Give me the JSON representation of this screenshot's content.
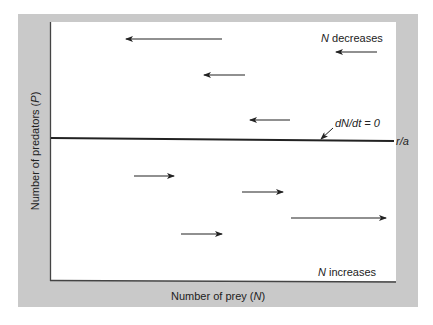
{
  "chart_data": {
    "type": "diagram",
    "title": "",
    "xlabel": "Number of prey (N)",
    "ylabel": "Number of predators (P)",
    "isocline": {
      "label": "dN/dt = 0",
      "y_intercept_label": "r/a",
      "orientation": "horizontal"
    },
    "regions": [
      {
        "position": "above",
        "label": "N decreases",
        "arrow_direction": "left"
      },
      {
        "position": "below",
        "label": "N increases",
        "arrow_direction": "right"
      }
    ],
    "arrows": [
      {
        "x1": 222,
        "y1": 39,
        "x2": 126,
        "y2": 39,
        "direction": "left"
      },
      {
        "x1": 377,
        "y1": 52,
        "x2": 336,
        "y2": 52,
        "direction": "left"
      },
      {
        "x1": 245,
        "y1": 75,
        "x2": 204,
        "y2": 75,
        "direction": "left"
      },
      {
        "x1": 290,
        "y1": 120,
        "x2": 250,
        "y2": 120,
        "direction": "left"
      },
      {
        "x1": 134,
        "y1": 176,
        "x2": 174,
        "y2": 176,
        "direction": "right"
      },
      {
        "x1": 242,
        "y1": 192,
        "x2": 283,
        "y2": 192,
        "direction": "right"
      },
      {
        "x1": 291,
        "y1": 218,
        "x2": 386,
        "y2": 218,
        "direction": "right"
      },
      {
        "x1": 181,
        "y1": 234,
        "x2": 222,
        "y2": 234,
        "direction": "right"
      }
    ]
  },
  "labels": {
    "x_axis_prefix": "Number of prey (",
    "x_axis_var": "N",
    "x_axis_suffix": ")",
    "y_axis_prefix": "Number of predators (",
    "y_axis_var": "P",
    "y_axis_suffix": ")",
    "top_region_var": "N",
    "top_region_text": " decreases",
    "bottom_region_var": "N",
    "bottom_region_text": " increases",
    "isocline_text": "dN/dt = 0",
    "isocline_intercept": "r/a"
  },
  "colors": {
    "panel": "#c9c9c9",
    "plot": "#ffffff",
    "ink": "#222222"
  }
}
